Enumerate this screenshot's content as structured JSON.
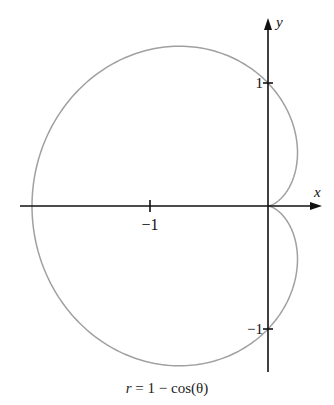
{
  "chart_data": {
    "type": "line",
    "subtype": "polar-curve",
    "title": "",
    "caption": "r = 1 − cos(θ)",
    "equation": {
      "lhs": "r",
      "rhs": "1 − cos(θ)"
    },
    "xlabel": "x",
    "ylabel": "y",
    "x_ticks": [
      {
        "value": -1,
        "label": "−1"
      }
    ],
    "y_ticks": [
      {
        "value": 1,
        "label": "1"
      },
      {
        "value": -1,
        "label": "−1"
      }
    ],
    "xlim": [
      -2.1,
      0.45
    ],
    "ylim": [
      -1.35,
      1.5
    ],
    "grid": false,
    "legend": null,
    "series": [
      {
        "name": "r = 1 − cos(θ)",
        "color": "#a0a0a0",
        "param": "theta",
        "theta_range": [
          0,
          6.2832
        ],
        "key_points": [
          {
            "x": 0,
            "y": 0
          },
          {
            "x": 0,
            "y": 1
          },
          {
            "x": -2,
            "y": 0
          },
          {
            "x": 0,
            "y": -1
          },
          {
            "x": -0.75,
            "y": 1.299
          },
          {
            "x": -0.75,
            "y": -1.299
          }
        ]
      }
    ]
  },
  "layout": {
    "origin_px": [
      268,
      206
    ],
    "scale_x_px": 118,
    "scale_y_px": 123,
    "axis_color": "#111111",
    "x_axis_px": [
      20,
      322
    ],
    "y_axis_px": [
      372,
      18
    ]
  }
}
